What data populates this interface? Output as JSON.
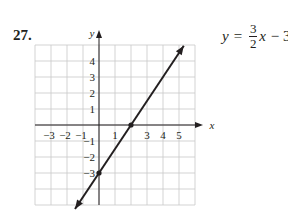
{
  "problem": {
    "number": "27.",
    "equation": {
      "lhs": "y",
      "equals": "=",
      "numerator": "3",
      "denominator": "2",
      "var": "x",
      "rest": "− 3"
    }
  },
  "axes": {
    "x_name": "x",
    "y_name": "y",
    "x_ticks": [
      "−3",
      "−2",
      "−1",
      "1",
      "3",
      "4",
      "5"
    ],
    "y_ticks": [
      "4",
      "3",
      "2",
      "1",
      "−1",
      "−2",
      "−3"
    ]
  },
  "chart_data": {
    "type": "line",
    "xlabel": "x",
    "ylabel": "y",
    "xlim": [
      -4,
      6
    ],
    "ylim": [
      -5,
      5
    ],
    "grid": true,
    "x_tick_labels": [
      -3,
      -2,
      -1,
      1,
      3,
      4,
      5
    ],
    "y_tick_labels": [
      4,
      3,
      2,
      1,
      -1,
      -2,
      -3
    ],
    "series": [
      {
        "name": "y = 3/2 x − 3",
        "slope": 1.5,
        "intercept": -3,
        "x": [
          -1.5,
          5.3
        ],
        "y": [
          -5.25,
          4.95
        ],
        "arrows_both_ends": true
      }
    ],
    "points": [
      {
        "x": 0,
        "y": -3,
        "label": "y-intercept"
      },
      {
        "x": 2,
        "y": 0,
        "label": "x-intercept"
      }
    ]
  },
  "colors": {
    "ink": "#231f20",
    "grid": "#c8c8c8"
  }
}
